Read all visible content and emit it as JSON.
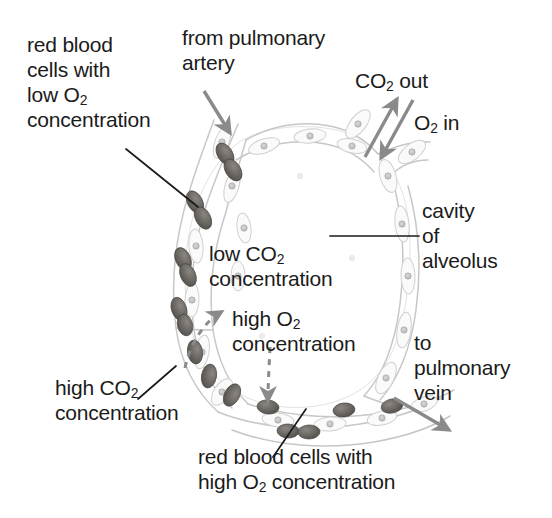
{
  "figure": {
    "background_color": "#ffffff"
  },
  "colors": {
    "text": "#1b1b1b",
    "leader_line": "#1b1b1b",
    "flow_arrow": "#8a8a8a",
    "diffusion_arrow": "#8a8a8a",
    "capillary_wall": "#c9c9c9",
    "alveolar_wall": "#d5d5d5",
    "red_blood_cell": "#6e6a66",
    "red_blood_cell_dark": "#55514e",
    "nucleus": "#b5b5b5",
    "alveolus_cavity": "#ffffff"
  },
  "labels": {
    "rbc_low_o2": {
      "id": "red-blood-cells-low-o2",
      "line1": "red blood",
      "line2": "cells with",
      "line3_prefix": "low O",
      "line3_sub": "2",
      "line4": "concentration"
    },
    "from_pulmonary_artery": {
      "id": "from-pulmonary-artery",
      "line1": "from pulmonary",
      "line2": "artery"
    },
    "co2_out": {
      "id": "co2-out",
      "prefix": "CO",
      "sub": "2",
      "suffix": " out"
    },
    "o2_in": {
      "id": "o2-in",
      "prefix": "O",
      "sub": "2",
      "suffix": " in"
    },
    "cavity_of_alveolus": {
      "id": "cavity-of-alveolus",
      "line1": "cavity",
      "line2": "of",
      "line3": "alveolus"
    },
    "low_co2": {
      "id": "low-co2-concentration",
      "line1_prefix": "low CO",
      "line1_sub": "2",
      "line2": "concentration"
    },
    "high_o2": {
      "id": "high-o2-concentration",
      "line1_prefix": "high O",
      "line1_sub": "2",
      "line2": "concentration"
    },
    "high_co2": {
      "id": "high-co2-concentration",
      "line1_prefix": "high CO",
      "line1_sub": "2",
      "line2": "concentration"
    },
    "to_pulmonary_vein": {
      "id": "to-pulmonary-vein",
      "line1": "to",
      "line2": "pulmonary",
      "line3": "vein"
    },
    "rbc_high_o2": {
      "id": "red-blood-cells-high-o2",
      "line1": "red blood cells with",
      "line2_prefix": "high O",
      "line2_sub": "2",
      "line2_suffix": " concentration"
    }
  },
  "annotations": {
    "leader_lines": [
      {
        "name": "leader-rbc-low-o2",
        "from": [
          126,
          149
        ],
        "to": [
          198,
          207
        ]
      },
      {
        "name": "leader-cavity-of-alveolus",
        "from": [
          419,
          236
        ],
        "to": [
          330,
          236
        ]
      },
      {
        "name": "leader-high-co2",
        "from": [
          176,
          366
        ],
        "to": [
          138,
          399
        ]
      },
      {
        "name": "leader-rbc-high-o2",
        "from": [
          273,
          457
        ],
        "to": [
          306,
          409
        ]
      }
    ],
    "flow_arrows": [
      {
        "name": "arrow-from-pulmonary-artery",
        "from": [
          204,
          91
        ],
        "to": [
          232,
          135
        ],
        "style": "solid"
      },
      {
        "name": "arrow-co2-out",
        "from": [
          365,
          155
        ],
        "to": [
          398,
          98
        ],
        "style": "solid"
      },
      {
        "name": "arrow-o2-in",
        "from": [
          412,
          101
        ],
        "to": [
          380,
          160
        ],
        "style": "solid"
      },
      {
        "name": "arrow-to-pulmonary-vein",
        "from": [
          394,
          398
        ],
        "to": [
          452,
          432
        ],
        "style": "solid"
      }
    ],
    "diffusion_arrows": [
      {
        "name": "arrow-low-co2-diffusion",
        "from": [
          185,
          368
        ],
        "to": [
          224,
          311
        ],
        "style": "dashed"
      },
      {
        "name": "arrow-high-o2-diffusion",
        "from": [
          270,
          347
        ],
        "to": [
          268,
          404
        ],
        "style": "dashed"
      }
    ]
  },
  "structures": {
    "alveolus": {
      "name": "alveolus-cavity",
      "description": "large rounded air sac"
    },
    "capillary": {
      "name": "capillary-network",
      "description": "capillary wrapping the alveolus"
    },
    "red_blood_cells_deoxygenated_count": 11,
    "red_blood_cells_oxygenated_count": 5,
    "alveolar_wall_cells_count": 14
  }
}
